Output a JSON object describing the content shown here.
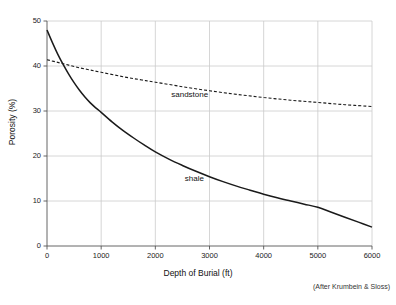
{
  "chart_data": {
    "type": "line",
    "title": "",
    "xlabel": "Depth of Burial (ft)",
    "ylabel": "Porosity (%)",
    "xlim": [
      0,
      6000
    ],
    "ylim": [
      0,
      50
    ],
    "xticks": [
      0,
      1000,
      2000,
      3000,
      4000,
      5000,
      6000
    ],
    "yticks": [
      0,
      10,
      20,
      30,
      40,
      50
    ],
    "xtick_labels": [
      "0",
      "1000",
      "2000",
      "3000",
      "4000",
      "5000",
      "6000"
    ],
    "ytick_labels": [
      "0",
      "10",
      "20",
      "30",
      "40",
      "50"
    ],
    "grid": true,
    "legend": "inline-annotations",
    "annotations": [
      {
        "text": "sandstone",
        "x": 2700,
        "y": 33.5
      },
      {
        "text": "shale",
        "x": 2950,
        "y": 14.8
      }
    ],
    "attribution": "(After Krumbein & Sloss)",
    "series": [
      {
        "name": "sandstone",
        "style": "dashed",
        "color": "#1a1a1a",
        "x": [
          0,
          200,
          400,
          600,
          800,
          1000,
          1250,
          1500,
          1750,
          2000,
          2500,
          3000,
          3500,
          4000,
          4500,
          5000,
          5500,
          6000
        ],
        "values": [
          41.4,
          40.8,
          40.2,
          39.6,
          39.1,
          38.6,
          38.0,
          37.4,
          36.9,
          36.4,
          35.4,
          34.5,
          33.7,
          33.0,
          32.4,
          31.9,
          31.4,
          31.0
        ]
      },
      {
        "name": "shale",
        "style": "solid",
        "color": "#1a1a1a",
        "x": [
          0,
          100,
          200,
          300,
          400,
          500,
          600,
          700,
          800,
          900,
          1000,
          1200,
          1400,
          1600,
          1800,
          2000,
          2250,
          2500,
          2750,
          3000,
          3250,
          3500,
          3750,
          4000,
          4250,
          4500,
          4750,
          5000,
          5250,
          5500,
          5750,
          6000
        ],
        "values": [
          48.0,
          45.2,
          42.6,
          40.3,
          38.2,
          36.3,
          34.6,
          33.1,
          31.8,
          30.7,
          29.7,
          27.6,
          25.7,
          24.0,
          22.4,
          20.9,
          19.3,
          17.9,
          16.6,
          15.4,
          14.3,
          13.3,
          12.4,
          11.5,
          10.7,
          10.0,
          9.3,
          8.6,
          7.5,
          6.4,
          5.3,
          4.2
        ]
      }
    ]
  },
  "axes_geometry": {
    "left": 47,
    "right": 372,
    "top": 21,
    "bottom": 246
  },
  "colors": {
    "background": "#ffffff",
    "grid": "#cccccc",
    "axis": "#555555",
    "ink": "#1a1a1a"
  }
}
